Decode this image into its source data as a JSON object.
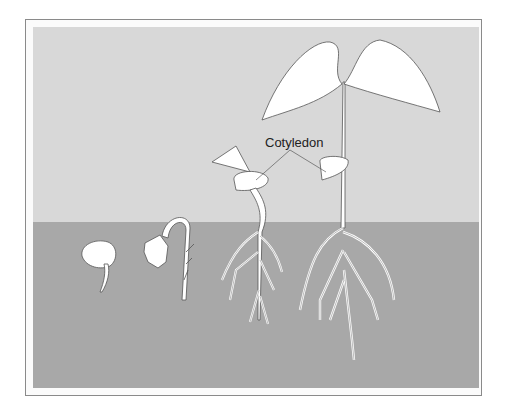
{
  "figure": {
    "labels": {
      "cotyledon": "Cotyledon"
    },
    "stages": [
      {
        "id": 1,
        "name": "seed-with-radicle"
      },
      {
        "id": 2,
        "name": "hook-emerging"
      },
      {
        "id": 3,
        "name": "seedling-cotyledons-raised"
      },
      {
        "id": 4,
        "name": "young-plant-true-leaves"
      }
    ],
    "colors": {
      "sky": "#d8d8d8",
      "ground": "#a8a8a8",
      "plant": "#ffffff",
      "outline": "#555555",
      "frame": "#8a8a8a"
    }
  }
}
